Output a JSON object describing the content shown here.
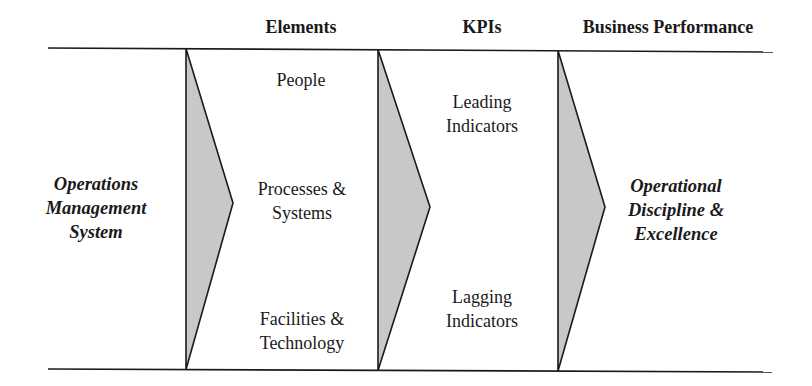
{
  "headers": {
    "elements": "Elements",
    "kpis": "KPIs",
    "business_performance": "Business Performance"
  },
  "source": {
    "lines": [
      "Operations",
      "Management",
      "System"
    ]
  },
  "elements": [
    {
      "lines": [
        "People"
      ]
    },
    {
      "lines": [
        "Processes &",
        "Systems"
      ]
    },
    {
      "lines": [
        "Facilities &",
        "Technology"
      ]
    }
  ],
  "kpis": [
    {
      "lines": [
        "Leading",
        "Indicators"
      ]
    },
    {
      "lines": [
        "Lagging",
        "Indicators"
      ]
    }
  ],
  "outcome": {
    "lines": [
      "Operational",
      "Discipline &",
      "Excellence"
    ]
  },
  "colors": {
    "line": "#1a1a1a",
    "chevron_fill": "#c8c8c8"
  }
}
